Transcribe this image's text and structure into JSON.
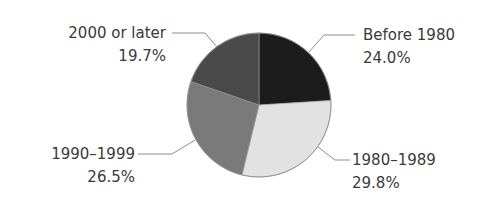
{
  "chart_data": {
    "type": "pie",
    "title": "",
    "start_angle_deg": 0,
    "direction": "clockwise",
    "slices": [
      {
        "label": "Before 1980",
        "value": 24.0,
        "display": "24.0%",
        "color": "#1c1c1c"
      },
      {
        "label": "1980–1989",
        "value": 29.8,
        "display": "29.8%",
        "color": "#e2e2e2"
      },
      {
        "label": "1990–1999",
        "value": 26.5,
        "display": "26.5%",
        "color": "#7a7a7a"
      },
      {
        "label": "2000 or later",
        "value": 19.7,
        "display": "19.7%",
        "color": "#4a4a4a"
      }
    ],
    "legend": "none (callout labels with leader lines)"
  },
  "labels": {
    "before_1980": {
      "name": "Before 1980",
      "pct": "24.0%"
    },
    "y1980_1989": {
      "name": "1980–1989",
      "pct": "29.8%"
    },
    "y1990_1999": {
      "name": "1990–1999",
      "pct": "26.5%"
    },
    "y2000_later": {
      "name": "2000 or later",
      "pct": "19.7%"
    }
  }
}
